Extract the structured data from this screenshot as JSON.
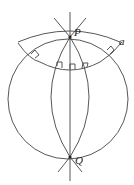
{
  "diagram": {
    "type": "geometry",
    "labels": {
      "P": "P",
      "Q": "Q",
      "a": "a"
    },
    "colors": {
      "stroke": "#444444",
      "background": "#ffffff"
    }
  }
}
